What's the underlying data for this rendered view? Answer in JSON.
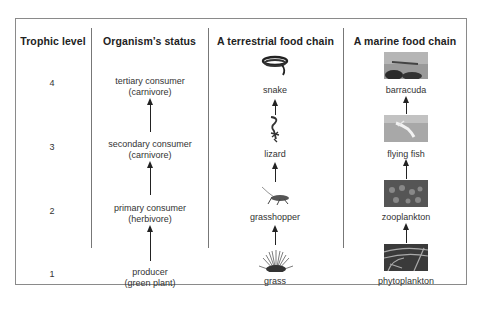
{
  "columns": {
    "trophic_level": "Trophic level",
    "status": "Organism’s status",
    "terrestrial": "A terrestrial food chain",
    "marine": "A marine food chain"
  },
  "levels": [
    {
      "level": "4",
      "status_line1": "tertiary consumer",
      "status_line2": "(carnivore)",
      "terrestrial": "snake",
      "terrestrial_icon": "snake-icon",
      "marine": "barracuda",
      "marine_icon": "barracuda-photo"
    },
    {
      "level": "3",
      "status_line1": "secondary consumer",
      "status_line2": "(carnivore)",
      "terrestrial": "lizard",
      "terrestrial_icon": "lizard-icon",
      "marine": "flying fish",
      "marine_icon": "flying-fish-photo"
    },
    {
      "level": "2",
      "status_line1": "primary consumer",
      "status_line2": "(herbivore)",
      "terrestrial": "grasshopper",
      "terrestrial_icon": "grasshopper-icon",
      "marine": "zooplankton",
      "marine_icon": "zooplankton-photo"
    },
    {
      "level": "1",
      "status_line1": "producer",
      "status_line2": "(green plant)",
      "terrestrial": "grass",
      "terrestrial_icon": "grass-icon",
      "marine": "phytoplankton",
      "marine_icon": "phytoplankton-photo"
    }
  ],
  "colors": {
    "border": "#8a8a8a",
    "text": "#222222",
    "arrow": "#222222"
  }
}
